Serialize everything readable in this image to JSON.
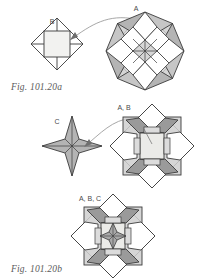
{
  "document": {
    "type": "geometric-assembly-diagram",
    "background_color": "#ffffff",
    "width": 197,
    "height": 280
  },
  "palette": {
    "stroke": "#3b3b3b",
    "stroke_light": "#8a8a8a",
    "fill_white": "#ffffff",
    "fill_pale": "#f0f0ee",
    "fill_light_gray": "#d9d9d9",
    "fill_mid_gray": "#b8b8b8",
    "fill_dark_gray": "#9a9a9a",
    "label_color": "#4a4a4a",
    "caption_color": "#5a5a5a",
    "arrow_color": "#808080"
  },
  "figures": [
    {
      "id": "fig-a",
      "caption": "Fig. 101.20a",
      "source_label": "B",
      "target_label": "A",
      "description": "Unit B (small square-in-diamond module) is inserted into assembly A (eight-pointed star of squares and triangles)."
    },
    {
      "id": "fig-b",
      "caption": "Fig. 101.20b",
      "source_label": "C",
      "target_label": "A, B",
      "description": "Unit C (four-pointed star module) is inserted into the combined A plus B assembly."
    },
    {
      "id": "fig-c",
      "caption": "Fig. 101.20c",
      "source_label": "",
      "target_label": "A, B, C",
      "description": "Completed assembly combining units A, B and C."
    }
  ],
  "labels": {
    "b": "B",
    "a": "A",
    "ab": "A, B",
    "c": "C",
    "abc": "A, B, C"
  },
  "captions": {
    "a": "Fig. 101.20a",
    "b": "Fig. 101.20b",
    "c": "Fig. 101.20c"
  }
}
